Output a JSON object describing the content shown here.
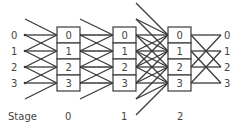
{
  "diagram": {
    "type": "multistage interconnection network",
    "rows": [
      "0",
      "1",
      "2",
      "3"
    ],
    "input_labels": [
      "0",
      "1",
      "2",
      "3"
    ],
    "output_labels": [
      "0",
      "1",
      "2",
      "3"
    ],
    "stage_label": "Stage",
    "stages": [
      {
        "label": "0",
        "cells": [
          "0",
          "1",
          "2",
          "3"
        ],
        "input_offsets": [
          -1,
          0,
          1
        ]
      },
      {
        "label": "1",
        "cells": [
          "0",
          "1",
          "2",
          "3"
        ],
        "input_offsets": [
          -1,
          0,
          1
        ]
      },
      {
        "label": "2",
        "cells": [
          "0",
          "1",
          "2",
          "3"
        ],
        "input_offsets": [
          -2,
          -1,
          0,
          1,
          2
        ]
      }
    ],
    "output_connections": [
      [
        0,
        0
      ],
      [
        0,
        2
      ],
      [
        1,
        1
      ],
      [
        1,
        3
      ],
      [
        2,
        0
      ],
      [
        2,
        2
      ],
      [
        3,
        1
      ],
      [
        3,
        3
      ]
    ],
    "colors": {
      "line": "#3a3a3a",
      "text": "#444444",
      "background": "#ffffff"
    }
  }
}
